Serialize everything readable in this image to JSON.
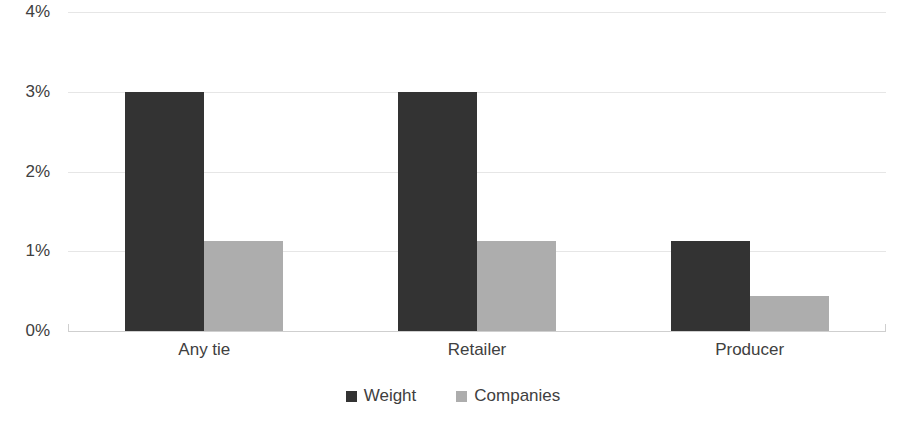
{
  "chart_data": {
    "type": "bar",
    "title": "",
    "subtitle": "",
    "xlabel": "",
    "ylabel": "",
    "categories": [
      "Any tie",
      "Retailer",
      "Producer"
    ],
    "series": [
      {
        "name": "Weight",
        "color": "#333333",
        "values": [
          3.0,
          3.0,
          1.13
        ]
      },
      {
        "name": "Companies",
        "color": "#adadad",
        "values": [
          1.13,
          1.13,
          0.44
        ]
      }
    ],
    "ylim": [
      0,
      4
    ],
    "ytick_values": [
      0,
      1,
      2,
      3,
      4
    ],
    "ytick_labels": [
      "0%",
      "1%",
      "2%",
      "3%",
      "4%"
    ],
    "value_suffix": "%",
    "grid": true,
    "grid_axis": "y",
    "grid_color": "#e6e6e6",
    "axis_color": "#cfcfcf",
    "legend_position": "bottom-center",
    "background_color": "#ffffff",
    "text_color": "#404040"
  },
  "legend": {
    "items": [
      {
        "label": "Weight",
        "color": "#333333"
      },
      {
        "label": "Companies",
        "color": "#adadad"
      }
    ]
  }
}
